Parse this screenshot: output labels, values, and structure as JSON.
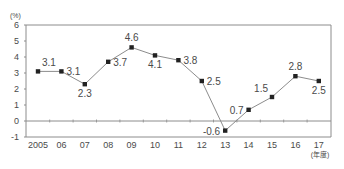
{
  "chart_data": {
    "type": "line",
    "title": "",
    "ylabel": "(%)",
    "xlabel": "(年度)",
    "categories": [
      "2005",
      "06",
      "07",
      "08",
      "09",
      "10",
      "11",
      "12",
      "13",
      "14",
      "15",
      "16",
      "17"
    ],
    "series": [
      {
        "name": "",
        "values": [
          3.1,
          3.1,
          2.3,
          3.7,
          4.6,
          4.1,
          3.8,
          2.5,
          -0.6,
          0.7,
          1.5,
          2.8,
          2.5
        ],
        "labels": [
          "3.1",
          "3.1",
          "2.3",
          "3.7",
          "4.6",
          "4.1",
          "3.8",
          "2.5",
          "-0.6",
          "0.7",
          "1.5",
          "2.8",
          "2.5"
        ],
        "label_positions": [
          "above-right",
          "right",
          "below",
          "right",
          "above",
          "below",
          "right",
          "right",
          "left",
          "left",
          "above-left",
          "above",
          "below"
        ]
      }
    ],
    "yticks": [
      6,
      5,
      4,
      3,
      2,
      1,
      0,
      -1
    ],
    "ylim": [
      -1,
      6
    ],
    "grid": false,
    "legend": "none",
    "colors": {
      "line": "#8c8c8c",
      "marker": "#222222",
      "frame": "#8c8c8c",
      "text": "#4a4a4a"
    }
  }
}
